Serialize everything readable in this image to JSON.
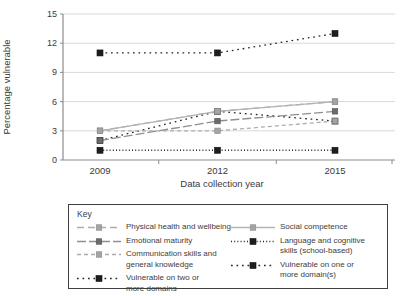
{
  "chart": {
    "ylabel": "Percentage vulnerable",
    "xlabel": "Data collection year",
    "legend_title": "Key"
  },
  "colors": {
    "grid": "#d9d9d9",
    "axis": "#8c8c8c",
    "tick_text": "#3a3a3a",
    "light_gray_series": "#adadad",
    "dark_gray_series": "#6b6b6b",
    "black_series": "#262626"
  },
  "chart_data": {
    "type": "line",
    "x_labels": [
      "2009",
      "2012",
      "2015"
    ],
    "xlabel": "Data collection year",
    "ylabel": "Percentage vulnerable",
    "y_ticks": [
      0,
      3,
      6,
      9,
      12,
      15
    ],
    "ylim": [
      0,
      15
    ],
    "grid": true,
    "legend_position": "bottom-box",
    "legend_title": "Key",
    "series": [
      {
        "name": "Physical health and wellbeing",
        "values": [
          3,
          5,
          6
        ],
        "line_color": "#adadad",
        "marker_color": "#a4a4a4",
        "marker_edge": "#8a8a8a",
        "dash": "7,4",
        "marker_size": 5.5,
        "legend_col": 1,
        "legend_lines": [
          "Physical health and wellbeing"
        ]
      },
      {
        "name": "Emotional maturity",
        "values": [
          2,
          4,
          5
        ],
        "line_color": "#8f8f8f",
        "marker_color": "#6b6b6b",
        "marker_edge": "#565656",
        "dash": "9,3",
        "marker_size": 5.5,
        "legend_col": 1,
        "legend_lines": [
          "Emotional maturity"
        ]
      },
      {
        "name": "Communication skills and general knowledge",
        "values": [
          3,
          3,
          4
        ],
        "line_color": "#adadad",
        "marker_color": "#a4a4a4",
        "marker_edge": "#8a8a8a",
        "dash": "4,3",
        "marker_size": 5.5,
        "legend_col": 1,
        "legend_lines": [
          "Communication skills and",
          "general knowledge"
        ]
      },
      {
        "name": "Vulnerable on two or more domains",
        "values": [
          2,
          5,
          4
        ],
        "line_color": "#262626",
        "marker_color": "#1e1e1e",
        "marker_edge": "#111111",
        "dash": "1.7,3.8",
        "marker_size": 6,
        "legend_col": 1,
        "legend_lines": [
          "Vulnerable on two or",
          "more domains"
        ]
      },
      {
        "name": "Social competence",
        "values": [
          3,
          5,
          6
        ],
        "line_color": "#b3b3b3",
        "marker_color": "#a4a4a4",
        "marker_edge": "#8a8a8a",
        "dash": "",
        "marker_size": 5.5,
        "legend_col": 2,
        "legend_lines": [
          "Social competence"
        ]
      },
      {
        "name": "Language and cognitive skills (school-based)",
        "values": [
          1,
          1,
          1
        ],
        "line_color": "#262626",
        "marker_color": "#1e1e1e",
        "marker_edge": "#111111",
        "dash": "1,2.2",
        "marker_size": 6,
        "legend_col": 2,
        "legend_lines": [
          "Language and cognitive",
          "skills (school-based)"
        ]
      },
      {
        "name": "Vulnerable on one or more domain(s)",
        "values": [
          11,
          11,
          13
        ],
        "line_color": "#262626",
        "marker_color": "#1e1e1e",
        "marker_edge": "#111111",
        "dash": "1.7,3.8",
        "marker_size": 6,
        "legend_col": 2,
        "legend_lines": [
          "Vulnerable on one or",
          "more domain(s)"
        ]
      }
    ]
  }
}
